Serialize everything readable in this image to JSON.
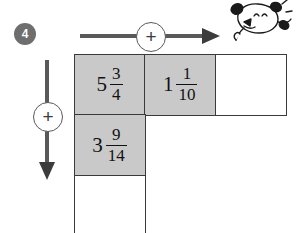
{
  "exercise": {
    "number": "4",
    "operation_symbol": "+"
  },
  "arrows": {
    "horizontal": {
      "name": "add-across-arrow",
      "operator": "+",
      "direction": "right"
    },
    "vertical": {
      "name": "add-down-arrow",
      "operator": "+",
      "direction": "down"
    }
  },
  "colors": {
    "cell_filled": "#c9c9c9",
    "cell_blank": "#ffffff",
    "cell_border": "#3a3a3a",
    "arrow": "#595959",
    "badge": "#6e6e6e",
    "text": "#111111"
  },
  "grid": {
    "rows": [
      {
        "cells": [
          {
            "name": "cell-r1c1",
            "state": "filled",
            "whole": "5",
            "numerator": "3",
            "denominator": "4",
            "value": "5 3/4"
          },
          {
            "name": "cell-r1c2",
            "state": "filled",
            "whole": "1",
            "numerator": "1",
            "denominator": "10",
            "value": "1 1/10"
          },
          {
            "name": "cell-r1c3-answer",
            "state": "blank",
            "whole": "",
            "numerator": "",
            "denominator": "",
            "value": ""
          }
        ]
      },
      {
        "cells": [
          {
            "name": "cell-r2c1",
            "state": "filled",
            "whole": "3",
            "numerator": "9",
            "denominator": "14",
            "value": "3 9/14"
          },
          {
            "name": "cell-r2c2-empty",
            "state": "hidden",
            "whole": "",
            "numerator": "",
            "denominator": "",
            "value": ""
          },
          {
            "name": "cell-r2c3-empty",
            "state": "hidden",
            "whole": "",
            "numerator": "",
            "denominator": "",
            "value": ""
          }
        ]
      },
      {
        "cells": [
          {
            "name": "cell-r3c1-answer",
            "state": "blank",
            "whole": "",
            "numerator": "",
            "denominator": "",
            "value": ""
          },
          {
            "name": "cell-r3c2-empty",
            "state": "hidden",
            "whole": "",
            "numerator": "",
            "denominator": "",
            "value": ""
          },
          {
            "name": "cell-r3c3-empty",
            "state": "hidden",
            "whole": "",
            "numerator": "",
            "denominator": "",
            "value": ""
          }
        ]
      }
    ]
  },
  "mascot": {
    "name": "cartoon-mouse-character"
  }
}
